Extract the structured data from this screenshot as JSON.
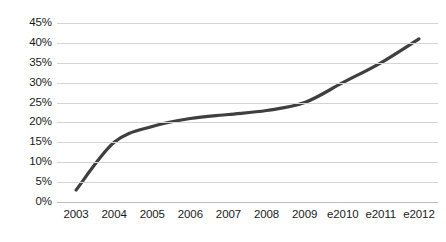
{
  "chart_data": {
    "type": "line",
    "title": "",
    "subtitle": "",
    "xlabel": "",
    "ylabel": "",
    "categories": [
      "2003",
      "2004",
      "2005",
      "2006",
      "2007",
      "2008",
      "2009",
      "e2010",
      "e2011",
      "e2012"
    ],
    "series": [
      {
        "name": "",
        "values": [
          3,
          15,
          19,
          21,
          22,
          23,
          25,
          30,
          35,
          41
        ]
      }
    ],
    "values": [
      3,
      15,
      19,
      21,
      22,
      23,
      25,
      30,
      35,
      41
    ],
    "ylim": [
      0,
      45
    ],
    "ytick_values": [
      0,
      5,
      10,
      15,
      20,
      25,
      30,
      35,
      40,
      45
    ],
    "ytick_labels": [
      "0%",
      "5%",
      "10%",
      "15%",
      "20%",
      "25%",
      "30%",
      "35%",
      "40%",
      "45%"
    ],
    "xtick_labels": [
      "2003",
      "2004",
      "2005",
      "2006",
      "2007",
      "2008",
      "2009",
      "e2010",
      "e2011",
      "e2012"
    ],
    "grid": true,
    "grid_axis": "y",
    "legend": false,
    "legend_position": "none",
    "annotations": [],
    "colors": {
      "line": "#3f3f3f",
      "gridline": "#d4d4d4",
      "baseline": "#bdbdbd",
      "background": "#ffffff",
      "text": "#1a1a1a"
    },
    "line_width": 3.2,
    "smooth": true,
    "markers": false
  }
}
